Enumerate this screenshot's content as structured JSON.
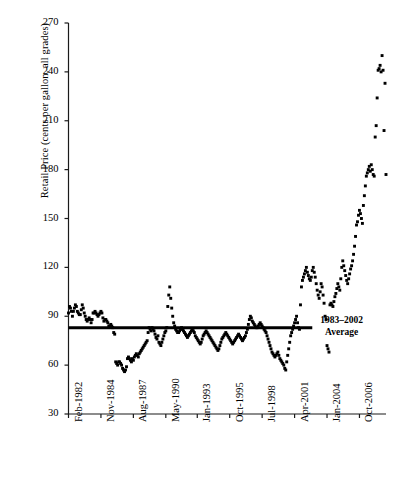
{
  "chart_data": {
    "type": "scatter",
    "title": "",
    "xlabel": "",
    "ylabel": "Retail Price (cents per gallon, all grades)",
    "ylim": [
      30,
      270
    ],
    "yticks": [
      30,
      60,
      90,
      120,
      150,
      180,
      210,
      240,
      270
    ],
    "grid": false,
    "legend": "none",
    "xtick_labels": [
      "Feb-1982",
      "Nov-1984",
      "Aug-1987",
      "May-1990",
      "Jan-1993",
      "Oct-1995",
      "Jul-1998",
      "Apr-2001",
      "Jan-2004",
      "Oct-2006"
    ],
    "xtick_indices": [
      0,
      33,
      66,
      99,
      131,
      164,
      197,
      230,
      263,
      296
    ],
    "x_start_label": "Feb-1982",
    "x_end_label": "Oct-2006",
    "n_points": 300,
    "point_color": "#000000",
    "point_marker": "square",
    "annotations": [
      {
        "name": "average-line",
        "type": "hline",
        "value": 83,
        "label_line1": "1983–2002",
        "label_line2": "Average",
        "x_from_index": 0,
        "x_to_index": 248,
        "color": "#000000"
      }
    ],
    "values": [
      92,
      96,
      95,
      93,
      90,
      93,
      95,
      97,
      96,
      93,
      92,
      91,
      91,
      94,
      97,
      95,
      92,
      90,
      88,
      87,
      88,
      89,
      88,
      86,
      88,
      92,
      92,
      93,
      92,
      91,
      90,
      91,
      92,
      93,
      92,
      89,
      87,
      88,
      88,
      87,
      86,
      84,
      84,
      85,
      84,
      83,
      80,
      79,
      62,
      61,
      60,
      62,
      62,
      61,
      60,
      58,
      57,
      56,
      57,
      59,
      64,
      65,
      64,
      63,
      62,
      64,
      63,
      65,
      66,
      67,
      66,
      65,
      67,
      68,
      69,
      70,
      71,
      72,
      73,
      74,
      75,
      80,
      83,
      82,
      81,
      83,
      82,
      81,
      79,
      77,
      76,
      78,
      74,
      73,
      72,
      74,
      76,
      78,
      80,
      81,
      83,
      96,
      103,
      108,
      101,
      95,
      90,
      86,
      84,
      82,
      81,
      80,
      80,
      81,
      82,
      83,
      82,
      81,
      80,
      79,
      78,
      77,
      78,
      79,
      80,
      81,
      82,
      81,
      80,
      78,
      77,
      76,
      75,
      74,
      73,
      74,
      76,
      78,
      79,
      80,
      81,
      80,
      79,
      78,
      77,
      76,
      75,
      74,
      73,
      72,
      71,
      70,
      69,
      70,
      72,
      74,
      76,
      77,
      78,
      79,
      80,
      79,
      78,
      77,
      76,
      75,
      74,
      73,
      74,
      75,
      76,
      77,
      78,
      79,
      78,
      77,
      76,
      75,
      76,
      77,
      78,
      80,
      82,
      85,
      88,
      90,
      89,
      87,
      86,
      85,
      84,
      83,
      83,
      84,
      85,
      86,
      85,
      84,
      83,
      82,
      81,
      80,
      78,
      76,
      74,
      72,
      70,
      68,
      67,
      66,
      65,
      66,
      67,
      68,
      66,
      64,
      63,
      62,
      61,
      60,
      58,
      57,
      62,
      66,
      70,
      74,
      78,
      80,
      82,
      84,
      86,
      88,
      90,
      86,
      83,
      82,
      97,
      108,
      112,
      114,
      116,
      118,
      120,
      117,
      115,
      113,
      112,
      114,
      118,
      120,
      117,
      114,
      110,
      106,
      103,
      101,
      105,
      110,
      108,
      103,
      98,
      90,
      88,
      72,
      70,
      68,
      97,
      98,
      97,
      96,
      99,
      102,
      104,
      107,
      110,
      108,
      106,
      113,
      120,
      124,
      121,
      118,
      115,
      112,
      110,
      113,
      116,
      119,
      121,
      124,
      128,
      133,
      139,
      146,
      148,
      152,
      155,
      153,
      150,
      147,
      158,
      164,
      170,
      176,
      178,
      180,
      182,
      179,
      183,
      180,
      177,
      176,
      200,
      207,
      224,
      241,
      242,
      244,
      240,
      250,
      241,
      204,
      233,
      177
    ],
    "value_note": "monthly U.S. retail gasoline price, cents per gallon, all grades"
  }
}
